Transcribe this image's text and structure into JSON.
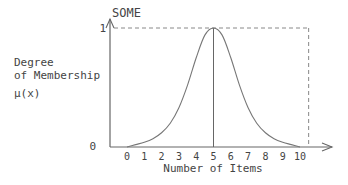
{
  "chart_data": {
    "type": "line",
    "title": "SOME",
    "ylabel_lines": [
      "Degree",
      "of Membership"
    ],
    "ylabel_symbol": "μ(x)",
    "xlabel": "Number of Items",
    "x_ticks": [
      "0",
      "1",
      "2",
      "3",
      "4",
      "5",
      "6",
      "7",
      "8",
      "9",
      "10"
    ],
    "y_ticks": [
      "0",
      "1"
    ],
    "xlim": [
      0,
      11.5
    ],
    "ylim": [
      0,
      1
    ],
    "peak": {
      "x": 5,
      "y": 1
    },
    "series": [
      {
        "name": "SOME",
        "x": [
          0,
          0.5,
          1,
          1.5,
          2,
          2.5,
          3,
          3.5,
          4,
          4.5,
          5,
          5.5,
          6,
          6.5,
          7,
          7.5,
          8,
          8.5,
          9,
          9.5,
          10
        ],
        "y": [
          0.0,
          0.02,
          0.04,
          0.07,
          0.12,
          0.2,
          0.33,
          0.52,
          0.75,
          0.94,
          1.0,
          0.94,
          0.75,
          0.52,
          0.33,
          0.2,
          0.12,
          0.07,
          0.04,
          0.02,
          0.0
        ]
      }
    ],
    "reference_lines": [
      {
        "type": "horizontal-dashed",
        "y": 1
      },
      {
        "type": "vertical-dashed",
        "x": 10.5
      },
      {
        "type": "vertical-solid",
        "x": 5
      }
    ],
    "grid": false,
    "legend": "none"
  }
}
